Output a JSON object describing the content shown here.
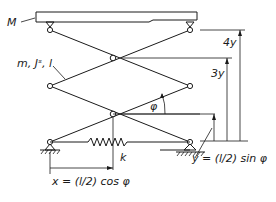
{
  "diagram": {
    "type": "scissor-lift mechanism",
    "labels": {
      "platform_mass": "M",
      "link_properties": "m, Jˢ, l",
      "angle": "φ",
      "spring": "k",
      "height_4y": "4y",
      "height_3y": "3y",
      "x_formula": "x = (l/2) cos φ",
      "y_formula": "y = (l/2) sin φ"
    },
    "components": [
      "platform",
      "scissor-links",
      "pin-joints",
      "spring",
      "fixed-support",
      "roller-support",
      "dimension-arrows"
    ]
  }
}
